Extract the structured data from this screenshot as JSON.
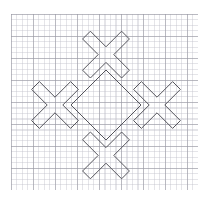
{
  "document": {
    "title": "Graph paper geometric figure",
    "background_color": "#ffffff"
  },
  "grid": {
    "name": "graph-paper",
    "left": 11,
    "top": 14,
    "width": 187,
    "height": 176,
    "minor_spacing_px": 5.5,
    "major_spacing_px": 22,
    "minor_color": "#bebec8",
    "major_color": "#9696a0",
    "paper_color": "#ffffff"
  },
  "figure": {
    "name": "four-crosses-diamond",
    "stroke_color": "#55555c",
    "stroke_width": 1,
    "fill": "none",
    "bounds": {
      "x_min": 30,
      "y_min": 26,
      "x_max": 182,
      "y_max": 181
    },
    "center": {
      "x": 106,
      "y": 104
    },
    "arm_half_width": 11,
    "crosses": [
      {
        "name": "top-cross",
        "center_x": 106,
        "center_y": 53
      },
      {
        "name": "left-cross",
        "center_x": 55,
        "center_y": 104
      },
      {
        "name": "right-cross",
        "center_x": 157,
        "center_y": 104
      },
      {
        "name": "bottom-cross",
        "center_x": 106,
        "center_y": 155
      }
    ],
    "outline_points": [
      [
        106,
        41.4
      ],
      [
        88.6,
        24.0
      ],
      [
        73.0,
        39.6
      ],
      [
        90.4,
        57.0
      ],
      [
        73.0,
        74.4
      ],
      [
        67.6,
        69.0
      ],
      [
        72.2,
        64.4
      ],
      [
        54.8,
        47.0
      ],
      [
        54.8,
        47.0
      ]
    ],
    "path_d": "M 106 41.4 L 88.6 24.0 L 73.0 39.6 L 90.4 57.0 L 73.0 74.4 L 55.6 57.0 L 38.2 74.4 L 55.6 91.8 L 38.2 109.2 L 20.8 91.8 L 5.2 107.4 L 22.6 124.8 L 5.2 142.2 L 20.8 157.8 L 38.2 140.4 L 55.6 157.8 L 73.0 140.4 L 90.4 157.8 L 73.0 175.2 L 88.6 190.8 L 106 173.4 L 123.4 190.8 L 139.0 175.2 L 121.6 157.8 L 139.0 140.4 L 156.4 157.8 L 173.8 140.4 L 156.4 122.9 L 173.8 105.5 L 191.2 122.9 L 206.8 107.4 L 189.4 90.0 L 206.8 72.6 L 191.2 57.0 L 173.8 74.4 L 156.4 57.0 L 139.0 74.4 L 121.6 57.0 L 139.0 39.6 L 123.4 24.0 Z"
  }
}
